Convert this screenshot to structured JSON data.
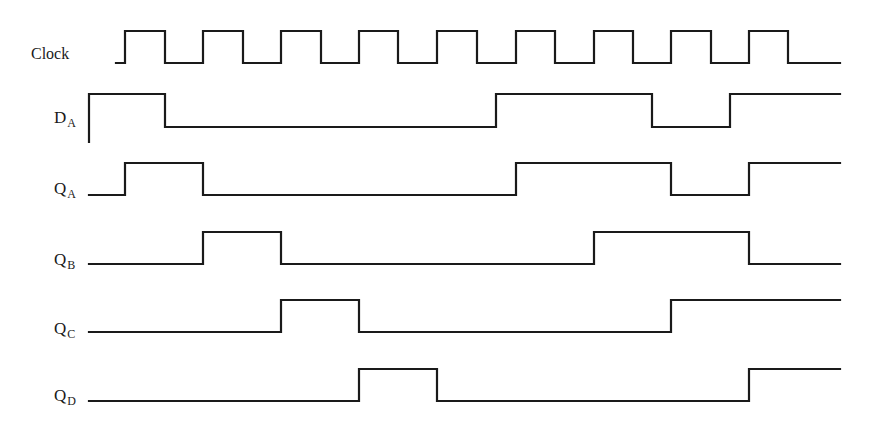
{
  "diagram": {
    "line_color": "#1a1a1a",
    "background": "#ffffff",
    "x_start": 89,
    "x_end": 840,
    "clock_edges_x": [
      125,
      165,
      203,
      243,
      281,
      321,
      359,
      398,
      437,
      477,
      516,
      555,
      594,
      633,
      671,
      711,
      749,
      788
    ],
    "signals": [
      {
        "id": "clock",
        "label": "Clock",
        "subscript": "",
        "label_x": 31,
        "label_y": 46,
        "y_high": 31,
        "y_low": 63,
        "x_start": 116,
        "initial": 0,
        "transitions_x": [
          125,
          165,
          203,
          243,
          281,
          321,
          359,
          398,
          437,
          477,
          516,
          555,
          594,
          633,
          671,
          711,
          749,
          788
        ]
      },
      {
        "id": "d_a",
        "label": "D",
        "subscript": "A",
        "label_x": 54,
        "label_y": 109,
        "y_high": 94,
        "y_low": 127,
        "x_start": 89,
        "start_drop_y": 142,
        "initial": 1,
        "transitions_x": [
          165,
          496,
          652,
          730
        ]
      },
      {
        "id": "q_a",
        "label": "Q",
        "subscript": "A",
        "label_x": 54,
        "label_y": 180,
        "y_high": 163,
        "y_low": 195,
        "x_start": 89,
        "initial": 0,
        "transitions_x": [
          125,
          203,
          516,
          671,
          749
        ]
      },
      {
        "id": "q_b",
        "label": "Q",
        "subscript": "B",
        "label_x": 54,
        "label_y": 251,
        "y_high": 232,
        "y_low": 264,
        "x_start": 89,
        "initial": 0,
        "transitions_x": [
          203,
          281,
          594,
          749
        ]
      },
      {
        "id": "q_c",
        "label": "Q",
        "subscript": "C",
        "label_x": 54,
        "label_y": 320,
        "y_high": 300,
        "y_low": 332,
        "x_start": 89,
        "initial": 0,
        "transitions_x": [
          281,
          359,
          671
        ]
      },
      {
        "id": "q_d",
        "label": "Q",
        "subscript": "D",
        "label_x": 54,
        "label_y": 387,
        "y_high": 369,
        "y_low": 401,
        "x_start": 89,
        "initial": 0,
        "transitions_x": [
          359,
          437,
          749
        ]
      }
    ]
  }
}
